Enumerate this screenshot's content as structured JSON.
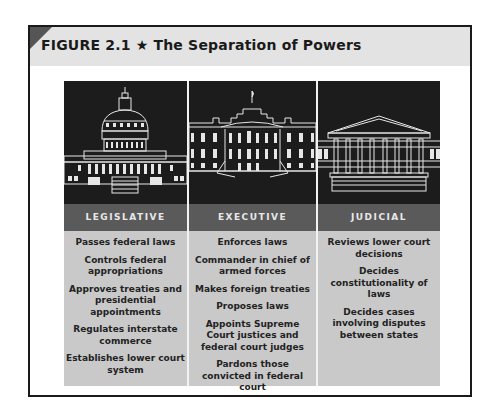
{
  "figure": {
    "label": "FIGURE 2.1",
    "star_icon": "★",
    "title": "The Separation of Powers"
  },
  "branches": [
    {
      "name": "LEGISLATIVE",
      "image": "capitol-building",
      "powers": [
        "Passes federal laws",
        "Controls federal appropriations",
        "Approves treaties and presidential appointments",
        "Regulates interstate commerce",
        "Establishes lower court system"
      ]
    },
    {
      "name": "EXECUTIVE",
      "image": "white-house",
      "powers": [
        "Enforces laws",
        "Commander in chief of armed forces",
        "Makes foreign treaties",
        "Proposes laws",
        "Appoints Supreme Court justices and federal court judges",
        "Pardons those convicted in federal court"
      ]
    },
    {
      "name": "JUDICIAL",
      "image": "supreme-court-building",
      "powers": [
        "Reviews lower court decisions",
        "Decides constitutionality of laws",
        "Decides cases involving disputes between states"
      ]
    }
  ],
  "colors": {
    "title_band": "#e3e3e3",
    "image_bg": "#1c1c1c",
    "header_band": "#5a5a5a",
    "content_bg": "#c9c9c9"
  }
}
